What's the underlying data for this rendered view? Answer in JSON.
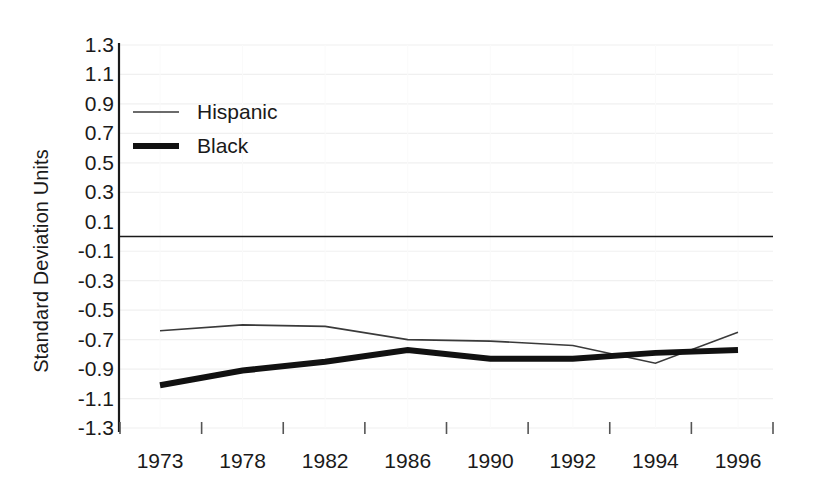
{
  "chart_data": {
    "type": "line",
    "title": "",
    "xlabel": "",
    "ylabel": "Standard Deviation Units",
    "x": [
      1973,
      1978,
      1982,
      1986,
      1990,
      1992,
      1994,
      1996
    ],
    "xtick_labels": [
      "1973",
      "1978",
      "1982",
      "1986",
      "1990",
      "1992",
      "1994",
      "1996"
    ],
    "ytick_labels": [
      "1.3",
      "1.1",
      "0.9",
      "0.7",
      "0.5",
      "0.3",
      "0.1",
      "-0.1",
      "-0.3",
      "-0.5",
      "-0.7",
      "-0.9",
      "-1.1",
      "-1.3"
    ],
    "ytick_values": [
      1.3,
      1.1,
      0.9,
      0.7,
      0.5,
      0.3,
      0.1,
      -0.1,
      -0.3,
      -0.5,
      -0.7,
      -0.9,
      -1.1,
      -1.3
    ],
    "ylim": [
      -1.3,
      1.3
    ],
    "grid": true,
    "zero_line": true,
    "legend_position": "upper-left",
    "series": [
      {
        "name": "Hispanic",
        "style": "thin",
        "color": "#3a3a3a",
        "width": 1.6,
        "values": [
          -0.64,
          -0.6,
          -0.61,
          -0.7,
          -0.71,
          -0.74,
          -0.86,
          -0.65
        ]
      },
      {
        "name": "Black",
        "style": "thick",
        "color": "#111111",
        "width": 6,
        "values": [
          -1.01,
          -0.91,
          -0.85,
          -0.77,
          -0.83,
          -0.83,
          -0.79,
          -0.77
        ]
      }
    ]
  },
  "legend": {
    "items": [
      {
        "label": "Hispanic"
      },
      {
        "label": "Black"
      }
    ]
  },
  "colors": {
    "axis": "#1a1a1a",
    "grid": "#f0f0f0",
    "hispanic": "#3a3a3a",
    "black": "#111111",
    "background": "#ffffff"
  }
}
